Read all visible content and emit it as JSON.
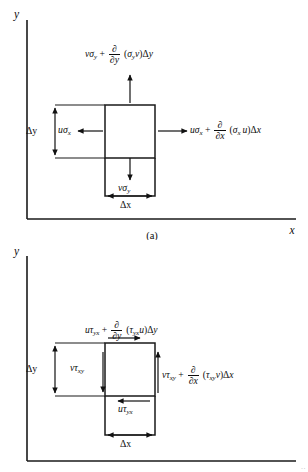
{
  "figure": {
    "background_color": "#ffffff",
    "ink_color": "#111111",
    "panels": [
      {
        "id": "panel-a",
        "caption": "(a)",
        "axes": {
          "y_label": "y",
          "x_label": "x"
        },
        "element_labels": {
          "delta_y": "Δy",
          "delta_x": "Δx",
          "left_face": {
            "base": "uσ",
            "sub": "x"
          },
          "bottom_face": {
            "base": "vσ",
            "sub": "y"
          }
        },
        "equations": [
          {
            "position": "top",
            "plain": "vσ_y + ∂/∂y (σ_y v)Δy",
            "lead_base": "vσ",
            "lead_sub": "y",
            "operator": "+",
            "frac_num": "∂",
            "frac_den": "∂y",
            "tail": "(σ_y v)Δy",
            "arrow_direction": "up"
          },
          {
            "position": "right",
            "plain": "uσ_x + ∂/∂x (σ_x u)Δx",
            "lead_base": "uσ",
            "lead_sub": "x",
            "operator": "+",
            "frac_num": "∂",
            "frac_den": "∂x",
            "tail": "(σ_x u)Δx",
            "arrow_direction": "right"
          }
        ],
        "arrows": [
          {
            "name": "top-normal-stress-arrow",
            "direction": "up"
          },
          {
            "name": "right-normal-stress-arrow",
            "direction": "right"
          },
          {
            "name": "left-normal-stress-arrow",
            "direction": "left"
          },
          {
            "name": "bottom-normal-stress-arrow",
            "direction": "down"
          }
        ]
      },
      {
        "id": "panel-b",
        "caption": "",
        "axes": {
          "y_label": "y",
          "x_label": ""
        },
        "element_labels": {
          "delta_y": "Δy",
          "delta_x": "Δx",
          "inner_face": {
            "base": "vτ",
            "sub": "xy"
          },
          "bottom_face": {
            "base": "uτ",
            "sub": "yx"
          }
        },
        "equations": [
          {
            "position": "top",
            "plain": "uτ_yx + ∂/∂y (τ_yx u)Δy",
            "lead_base": "uτ",
            "lead_sub": "yx",
            "operator": "+",
            "frac_num": "∂",
            "frac_den": "∂y",
            "tail": "(τ_yx u)Δy",
            "arrow_direction": "right"
          },
          {
            "position": "right",
            "plain": "vτ_xy + ∂/∂x (τ_xy v)Δx",
            "lead_base": "vτ",
            "lead_sub": "xy",
            "operator": "+",
            "frac_num": "∂",
            "frac_den": "∂x",
            "tail": "(τ_xy v)Δx",
            "arrow_direction": "up"
          }
        ],
        "arrows": [
          {
            "name": "top-shear-stress-arrow",
            "direction": "right"
          },
          {
            "name": "right-shear-stress-arrow",
            "direction": "up"
          },
          {
            "name": "inner-shear-stress-arrow",
            "direction": "down"
          },
          {
            "name": "bottom-shear-stress-arrow",
            "direction": "left"
          }
        ]
      }
    ],
    "page_edge_mark": "··"
  }
}
